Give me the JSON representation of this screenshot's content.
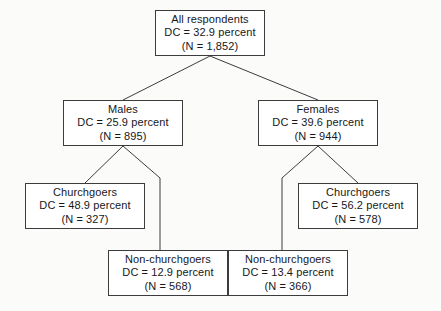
{
  "diagram": {
    "type": "tree",
    "title": "",
    "nodes": [
      {
        "id": "all-respondents",
        "label": "All respondents",
        "dc_line": "DC = 32.9 percent",
        "n_line": "(N = 1,852)",
        "dc_percent": 32.9,
        "n": 1852,
        "level": 0
      },
      {
        "id": "males",
        "label": "Males",
        "dc_line": "DC = 25.9 percent",
        "n_line": "(N = 895)",
        "dc_percent": 25.9,
        "n": 895,
        "level": 1
      },
      {
        "id": "females",
        "label": "Females",
        "dc_line": "DC = 39.6 percent",
        "n_line": "(N = 944)",
        "dc_percent": 39.6,
        "n": 944,
        "level": 1
      },
      {
        "id": "males-churchgoers",
        "label": "Churchgoers",
        "dc_line": "DC = 48.9 percent",
        "n_line": "(N = 327)",
        "dc_percent": 48.9,
        "n": 327,
        "level": 2
      },
      {
        "id": "females-churchgoers",
        "label": "Churchgoers",
        "dc_line": "DC = 56.2 percent",
        "n_line": "(N = 578)",
        "dc_percent": 56.2,
        "n": 578,
        "level": 2
      },
      {
        "id": "males-non-churchgoers",
        "label": "Non-churchgoers",
        "dc_line": "DC = 12.9 percent",
        "n_line": "(N = 568)",
        "dc_percent": 12.9,
        "n": 568,
        "level": 3
      },
      {
        "id": "females-non-churchgoers",
        "label": "Non-churchgoers",
        "dc_line": "DC = 13.4 percent",
        "n_line": "(N = 366)",
        "dc_percent": 13.4,
        "n": 366,
        "level": 3
      }
    ],
    "edges": [
      {
        "from": "all-respondents",
        "to": "males"
      },
      {
        "from": "all-respondents",
        "to": "females"
      },
      {
        "from": "males",
        "to": "males-churchgoers"
      },
      {
        "from": "males",
        "to": "males-non-churchgoers"
      },
      {
        "from": "females",
        "to": "females-churchgoers"
      },
      {
        "from": "females",
        "to": "females-non-churchgoers"
      }
    ],
    "colors": {
      "background": "#fbfbfa",
      "box_fill": "#ffffff",
      "box_border": "#3c3c3c",
      "edge_line": "#3c3c3c",
      "text": "#17171a"
    }
  }
}
